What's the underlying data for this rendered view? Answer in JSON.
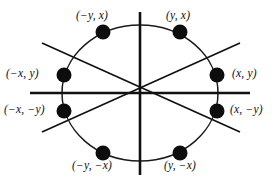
{
  "figure": {
    "kind": "circle-eight-way-symmetry-diagram",
    "background_color": "#ffffff",
    "ink_color": "#0d0d0d"
  },
  "geometry": {
    "center": {
      "x": 140,
      "y": 93
    },
    "ellipse": {
      "rx": 78,
      "ry": 68
    },
    "dot_radius": 7.5,
    "axes": {
      "vertical": {
        "x": 140,
        "y1": 12,
        "y2": 175
      },
      "horizontal": {
        "y": 93,
        "x1": 30,
        "x2": 250
      },
      "diagonal_up": {
        "x1": 42,
        "y1": 132,
        "x2": 240,
        "y2": 43
      },
      "diagonal_down": {
        "x1": 42,
        "y1": 43,
        "x2": 240,
        "y2": 132
      }
    }
  },
  "points": [
    {
      "id": "top-left",
      "label": "(−y, x)",
      "open": "(",
      "first": "−y",
      "second": "x",
      "close": ")",
      "cx": 103,
      "cy": 32
    },
    {
      "id": "top-right",
      "label": "(y, x)",
      "open": "(",
      "first": "y",
      "second": "x",
      "close": ")",
      "cx": 180,
      "cy": 32
    },
    {
      "id": "left-up",
      "label": "(−x, y)",
      "open": "(",
      "first": "−x",
      "second": "y",
      "close": ")",
      "cx": 64,
      "cy": 75
    },
    {
      "id": "right-up",
      "label": "(x, y)",
      "open": "(",
      "first": "x",
      "second": "y",
      "close": ")",
      "cx": 217,
      "cy": 75
    },
    {
      "id": "left-down",
      "label": "(−x, −y)",
      "open": "(",
      "first": "−x",
      "second": "−y",
      "close": ")",
      "cx": 64,
      "cy": 111
    },
    {
      "id": "right-down",
      "label": "(x, −y)",
      "open": "(",
      "first": "x",
      "second": "−y",
      "close": ")",
      "cx": 217,
      "cy": 111
    },
    {
      "id": "bot-left",
      "label": "(−y, −x)",
      "open": "(",
      "first": "−y",
      "second": "−x",
      "close": ")",
      "cx": 103,
      "cy": 153
    },
    {
      "id": "bot-right",
      "label": "(y, −x)",
      "open": "(",
      "first": "y",
      "second": "−x",
      "close": ")",
      "cx": 180,
      "cy": 153
    }
  ],
  "labels": {
    "top_left": "(−y, x)",
    "top_right": "(y, x)",
    "left_upper": "(−x, y)",
    "right_upper": "(x, y)",
    "left_lower": "(−x, −y)",
    "right_lower": "(x, −y)",
    "bottom_left": "(−y, −x)",
    "bottom_right": "(y, −x)"
  }
}
